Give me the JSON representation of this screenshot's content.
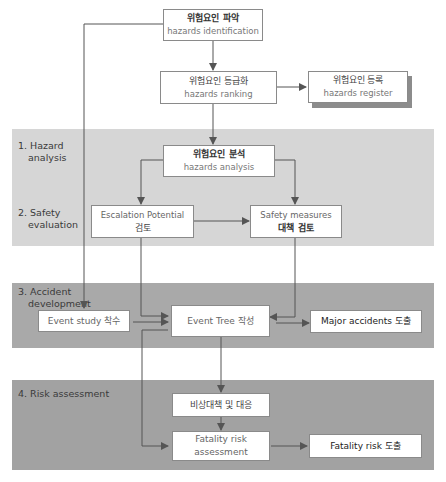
{
  "stages": [
    {
      "id": "hazard-analysis",
      "label": "1. Hazard\nanalysis",
      "line1": "1. Hazard",
      "line2": "analysis"
    },
    {
      "id": "safety-evaluation",
      "label": "2. Safety\nevaluation",
      "line1": "2. Safety",
      "line2": "evaluation"
    },
    {
      "id": "accident-development",
      "label": "3. Accident\ndevelopment",
      "line1": "3. Accident",
      "line2": "development"
    },
    {
      "id": "risk-assessment",
      "label": "4. Risk assessment",
      "line1": "4. Risk assessment"
    }
  ],
  "nodes": {
    "hazards_identification": {
      "ko": "위험요인 파악",
      "en": "hazards identification"
    },
    "hazards_ranking": {
      "ko": "위험요인 등급화",
      "en": "hazards ranking"
    },
    "hazards_register": {
      "ko": "위험요인 등록",
      "en": "hazards register"
    },
    "hazards_analysis": {
      "ko": "위험요인 분석",
      "en": "hazards analysis"
    },
    "escalation_potential": {
      "en": "Escalation Potential",
      "ko": "검토"
    },
    "safety_measures": {
      "en": "Safety measures",
      "ko": "대책 검토"
    },
    "event_study": {
      "label": "Event study 착수"
    },
    "event_tree": {
      "label": "Event Tree 작성"
    },
    "major_accidents": {
      "label": "Major accidents 도출"
    },
    "emergency_response": {
      "label": "비상대책 및 대응"
    },
    "fatality_risk_assessment": {
      "label": "Fatality risk assessment"
    },
    "fatality_risk": {
      "label": "Fatality risk 도출"
    }
  },
  "colors": {
    "band_light": "#d6d6d6",
    "band_accident": "#a9a9a9",
    "band_risk": "#a2a2a2",
    "line": "#555555",
    "box_border": "#8a8a8a"
  }
}
